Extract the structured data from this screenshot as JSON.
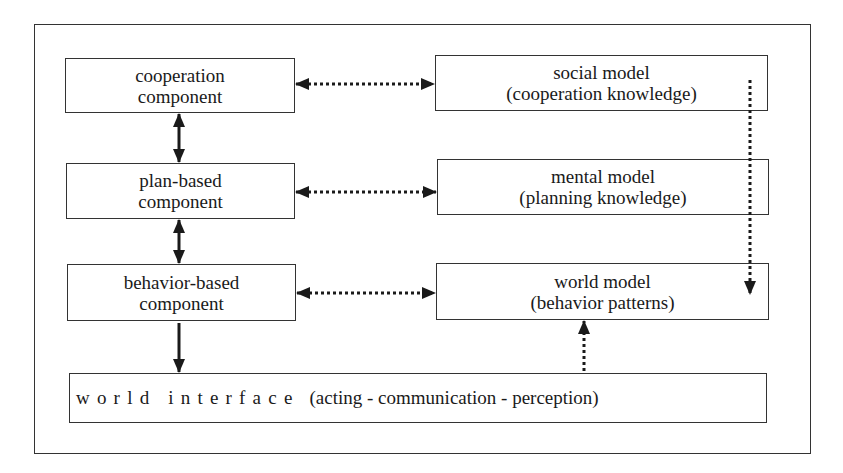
{
  "diagram": {
    "left_column": [
      {
        "line1": "cooperation",
        "line2": "component"
      },
      {
        "line1": "plan-based",
        "line2": "component"
      },
      {
        "line1": "behavior-based",
        "line2": "component"
      }
    ],
    "right_column": [
      {
        "line1": "social model",
        "line2": "(cooperation knowledge)"
      },
      {
        "line1": "mental model",
        "line2": "(planning knowledge)"
      },
      {
        "line1": "world model",
        "line2": "(behavior patterns)"
      }
    ],
    "bottom": {
      "spaced_label": "world interface",
      "detail": "(acting - communication - perception)"
    },
    "connections": [
      {
        "from": "cooperation component",
        "to": "social model",
        "style": "dotted",
        "direction": "bidirectional"
      },
      {
        "from": "plan-based component",
        "to": "mental model",
        "style": "dotted",
        "direction": "bidirectional"
      },
      {
        "from": "behavior-based component",
        "to": "world model",
        "style": "dotted",
        "direction": "bidirectional"
      },
      {
        "from": "cooperation component",
        "to": "plan-based component",
        "style": "solid",
        "direction": "bidirectional"
      },
      {
        "from": "plan-based component",
        "to": "behavior-based component",
        "style": "solid",
        "direction": "bidirectional"
      },
      {
        "from": "behavior-based component",
        "to": "world interface",
        "style": "solid",
        "direction": "forward"
      },
      {
        "from": "world interface",
        "to": "world model",
        "style": "dotted",
        "direction": "forward"
      },
      {
        "from": "social model",
        "to": "world model",
        "style": "dotted",
        "direction": "forward"
      }
    ],
    "colors": {
      "line": "#1a1a1a",
      "background": "#ffffff"
    }
  }
}
